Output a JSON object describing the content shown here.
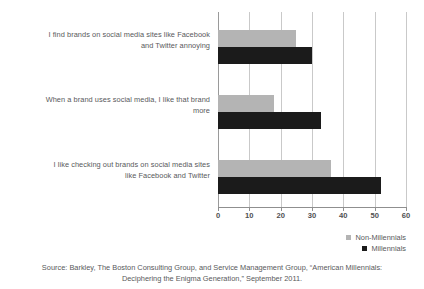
{
  "chart_data": {
    "type": "bar",
    "orientation": "horizontal",
    "title": "",
    "xlabel": "",
    "ylabel": "",
    "xlim": [
      0,
      60
    ],
    "xticks": [
      0,
      10,
      20,
      30,
      40,
      50,
      60
    ],
    "xtick_labels": [
      "0",
      "10",
      "20",
      "30",
      "40",
      "50",
      "60"
    ],
    "grid": true,
    "legend_position": "bottom-right",
    "categories": [
      "I find brands on social media sites like Facebook and Twitter annoying",
      "When a brand uses social media, I like that brand more",
      "I like checking out brands on social media sites like Facebook and Twitter"
    ],
    "category_lines": [
      [
        "I find brands on social media sites like Facebook",
        "and Twitter annoying"
      ],
      [
        "When a brand uses social media, I like that brand",
        "more"
      ],
      [
        "I like checking out brands on social media sites",
        "like Facebook and Twitter"
      ]
    ],
    "series": [
      {
        "name": "Non-Millennials",
        "color": "#b4b4b4",
        "values": [
          25,
          18,
          36
        ]
      },
      {
        "name": "Millennials",
        "color": "#1b1b1b",
        "values": [
          30,
          33,
          52
        ]
      }
    ]
  },
  "legend": {
    "items": [
      {
        "label": "Non-Millennials",
        "color": "#b4b4b4"
      },
      {
        "label": "Millennials",
        "color": "#1b1b1b"
      }
    ]
  },
  "source": {
    "line1": "Source: Barkley, The Boston Consulting Group, and Service Management Group, “American Millennials:",
    "line2": "Deciphering the Enigma Generation,” September 2011."
  },
  "colors": {
    "non_millennials": "#b4b4b4",
    "millennials": "#1b1b1b",
    "gridline": "#c9c9c9",
    "axis": "#8f8f8f",
    "text": "#58595b",
    "background": "#ffffff"
  }
}
